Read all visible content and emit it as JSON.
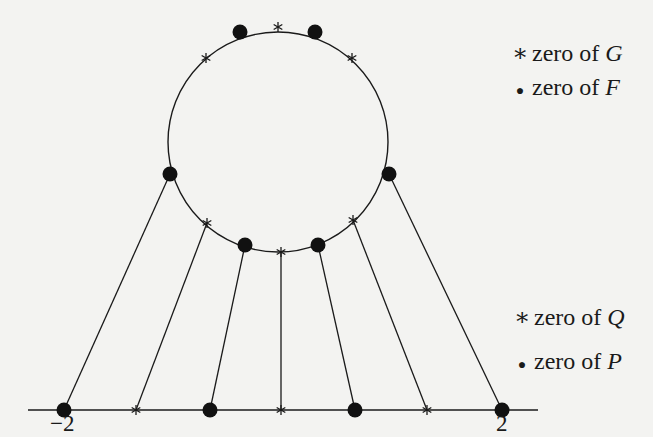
{
  "diagram": {
    "caption": {
      "n": "n",
      "eq1": " = 2",
      "d1": "d",
      "sep": ",  ",
      "d2": "d",
      "eq2": " = 3"
    },
    "axis_labels": {
      "left": "−2",
      "right": "2"
    },
    "legend_top": [
      {
        "symbol": "∗",
        "icon": "star-icon",
        "text": "zero of ",
        "var": "G"
      },
      {
        "symbol": "●",
        "icon": "dot-icon",
        "text": "zero of ",
        "var": "F"
      }
    ],
    "legend_bottom": [
      {
        "symbol": "∗",
        "icon": "star-icon",
        "text": "zero of ",
        "var": "Q"
      },
      {
        "symbol": "●",
        "icon": "dot-icon",
        "text": "zero of ",
        "var": "P"
      }
    ],
    "circle": {
      "cx": 278,
      "cy": 142,
      "r": 110
    },
    "line": {
      "x1": 28,
      "x2": 538,
      "y": 410
    },
    "zeros_F": [
      [
        240,
        32
      ],
      [
        315,
        32
      ],
      [
        170,
        174
      ],
      [
        389,
        174
      ],
      [
        245,
        245
      ],
      [
        318,
        245
      ]
    ],
    "zeros_G": [
      [
        278,
        27
      ],
      [
        206,
        58
      ],
      [
        352,
        58
      ],
      [
        207,
        223
      ],
      [
        353,
        220
      ],
      [
        281,
        252
      ]
    ],
    "zeros_P": [
      [
        64,
        410
      ],
      [
        210,
        410
      ],
      [
        355,
        410
      ],
      [
        502,
        410
      ]
    ],
    "zeros_Q": [
      [
        136,
        410
      ],
      [
        281,
        410
      ],
      [
        427,
        410
      ]
    ],
    "connectors": [
      [
        170,
        174,
        64,
        410
      ],
      [
        207,
        223,
        136,
        410
      ],
      [
        245,
        245,
        210,
        410
      ],
      [
        281,
        252,
        281,
        410
      ],
      [
        318,
        245,
        355,
        410
      ],
      [
        353,
        220,
        427,
        410
      ],
      [
        389,
        174,
        502,
        410
      ]
    ],
    "colors": {
      "ink": "#1a1a1a",
      "background": "#f3f3f1"
    }
  }
}
